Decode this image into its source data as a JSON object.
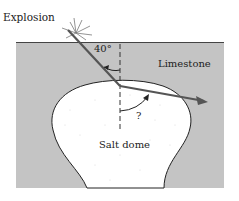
{
  "diagram": {
    "labels": {
      "explosion": "Explosion",
      "incidence_angle": "40°",
      "upper_layer": "Limestone",
      "refraction_angle": "?",
      "lower_body": "Salt dome"
    },
    "colors": {
      "limestone": "#c4c4c4",
      "salt_dome": "#ffffff",
      "ray": "#555555",
      "outline": "#222222"
    }
  }
}
